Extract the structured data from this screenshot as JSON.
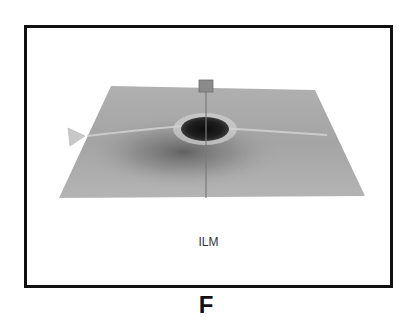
{
  "figure": {
    "panel_label": "F",
    "layer_caption": "ILM",
    "colors": {
      "frame_border": "#111111",
      "surface_base": "#a8a8a8",
      "surface_light": "#c4c4c4",
      "fovea_dark": "#1a1a1a",
      "marker": "#8a8a8a",
      "marker_line": "#7a7a7a",
      "side_marker": "#c8c8c8"
    }
  }
}
